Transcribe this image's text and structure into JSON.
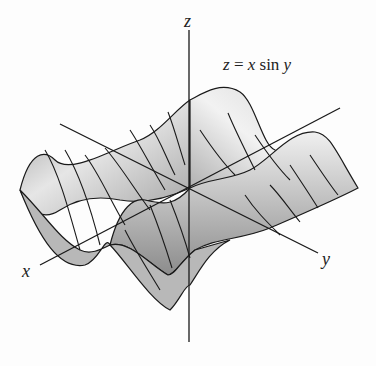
{
  "figure": {
    "equation": {
      "lhs": "z",
      "eq": " = ",
      "x": "x",
      "fn": " sin ",
      "y": "y"
    },
    "axes": {
      "z_label": "z",
      "x_label": "x",
      "y_label": "y"
    },
    "surface": {
      "function": "z = x sin y",
      "type": "3D surface with grid lines"
    },
    "colors": {
      "surface_light": "#e8e8e8",
      "surface_dark": "#8a8a8a",
      "lines": "#1a1a1a",
      "background": "#fdfdfd"
    }
  }
}
